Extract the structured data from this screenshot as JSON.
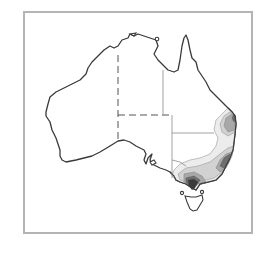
{
  "figure": {
    "type": "choropleth-contour-map",
    "region": "Australia",
    "colors": {
      "frame": "#b4b4b4",
      "coastline": "#3a3a3a",
      "state_border": "#555555",
      "level_1": "#ececec",
      "level_2": "#d2d2d2",
      "level_3": "#a8a8a8",
      "level_4": "#6e6e6e",
      "level_5": "#3c3c3c"
    },
    "shaded_region": "south-east coast (Queensland / New South Wales / Victoria)"
  }
}
